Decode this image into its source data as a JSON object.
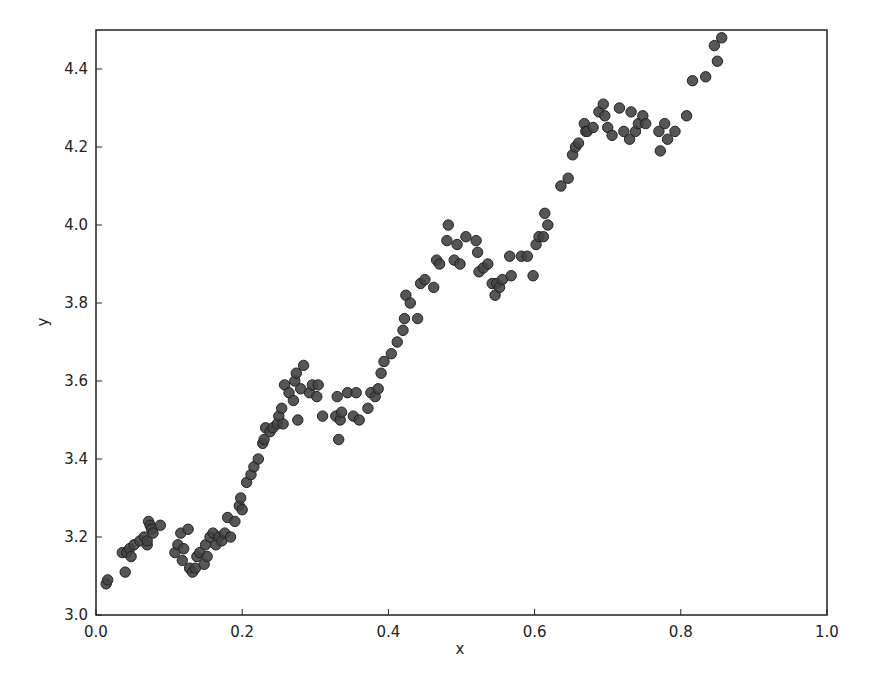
{
  "chart_data": {
    "type": "scatter",
    "title": "",
    "xlabel": "x",
    "ylabel": "y",
    "xlim": [
      0.0,
      1.0
    ],
    "ylim": [
      3.0,
      4.5
    ],
    "grid": false,
    "legend": null,
    "xticks": [
      "0.0",
      "0.2",
      "0.4",
      "0.6",
      "0.8",
      "1.0"
    ],
    "yticks": [
      "3.0",
      "3.2",
      "3.4",
      "3.6",
      "3.8",
      "4.0",
      "4.2",
      "4.4"
    ],
    "marker_color": "#444444",
    "marker_edge_color": "#222222",
    "series": [
      {
        "name": "data",
        "points": [
          [
            0.014,
            3.08
          ],
          [
            0.016,
            3.09
          ],
          [
            0.036,
            3.16
          ],
          [
            0.04,
            3.11
          ],
          [
            0.042,
            3.16
          ],
          [
            0.046,
            3.17
          ],
          [
            0.048,
            3.15
          ],
          [
            0.052,
            3.18
          ],
          [
            0.06,
            3.19
          ],
          [
            0.066,
            3.2
          ],
          [
            0.07,
            3.18
          ],
          [
            0.07,
            3.19
          ],
          [
            0.072,
            3.24
          ],
          [
            0.074,
            3.23
          ],
          [
            0.076,
            3.22
          ],
          [
            0.078,
            3.21
          ],
          [
            0.088,
            3.23
          ],
          [
            0.108,
            3.16
          ],
          [
            0.112,
            3.18
          ],
          [
            0.116,
            3.21
          ],
          [
            0.118,
            3.14
          ],
          [
            0.12,
            3.17
          ],
          [
            0.126,
            3.22
          ],
          [
            0.128,
            3.12
          ],
          [
            0.132,
            3.11
          ],
          [
            0.136,
            3.12
          ],
          [
            0.138,
            3.15
          ],
          [
            0.142,
            3.16
          ],
          [
            0.148,
            3.13
          ],
          [
            0.15,
            3.18
          ],
          [
            0.152,
            3.15
          ],
          [
            0.156,
            3.2
          ],
          [
            0.16,
            3.21
          ],
          [
            0.164,
            3.18
          ],
          [
            0.168,
            3.2
          ],
          [
            0.172,
            3.19
          ],
          [
            0.176,
            3.21
          ],
          [
            0.18,
            3.25
          ],
          [
            0.184,
            3.2
          ],
          [
            0.19,
            3.24
          ],
          [
            0.196,
            3.28
          ],
          [
            0.198,
            3.3
          ],
          [
            0.2,
            3.27
          ],
          [
            0.206,
            3.34
          ],
          [
            0.212,
            3.36
          ],
          [
            0.216,
            3.38
          ],
          [
            0.222,
            3.4
          ],
          [
            0.228,
            3.44
          ],
          [
            0.23,
            3.45
          ],
          [
            0.232,
            3.48
          ],
          [
            0.238,
            3.47
          ],
          [
            0.242,
            3.48
          ],
          [
            0.248,
            3.49
          ],
          [
            0.25,
            3.51
          ],
          [
            0.254,
            3.53
          ],
          [
            0.256,
            3.49
          ],
          [
            0.258,
            3.59
          ],
          [
            0.264,
            3.57
          ],
          [
            0.27,
            3.55
          ],
          [
            0.272,
            3.6
          ],
          [
            0.274,
            3.62
          ],
          [
            0.276,
            3.5
          ],
          [
            0.28,
            3.58
          ],
          [
            0.284,
            3.64
          ],
          [
            0.292,
            3.57
          ],
          [
            0.296,
            3.59
          ],
          [
            0.302,
            3.56
          ],
          [
            0.304,
            3.59
          ],
          [
            0.31,
            3.51
          ],
          [
            0.328,
            3.51
          ],
          [
            0.33,
            3.56
          ],
          [
            0.332,
            3.45
          ],
          [
            0.334,
            3.5
          ],
          [
            0.336,
            3.52
          ],
          [
            0.344,
            3.57
          ],
          [
            0.352,
            3.51
          ],
          [
            0.356,
            3.57
          ],
          [
            0.36,
            3.5
          ],
          [
            0.372,
            3.53
          ],
          [
            0.376,
            3.57
          ],
          [
            0.382,
            3.56
          ],
          [
            0.386,
            3.58
          ],
          [
            0.39,
            3.62
          ],
          [
            0.394,
            3.65
          ],
          [
            0.404,
            3.67
          ],
          [
            0.412,
            3.7
          ],
          [
            0.42,
            3.73
          ],
          [
            0.422,
            3.76
          ],
          [
            0.424,
            3.82
          ],
          [
            0.43,
            3.8
          ],
          [
            0.44,
            3.76
          ],
          [
            0.444,
            3.85
          ],
          [
            0.45,
            3.86
          ],
          [
            0.462,
            3.84
          ],
          [
            0.466,
            3.91
          ],
          [
            0.47,
            3.9
          ],
          [
            0.48,
            3.96
          ],
          [
            0.482,
            4.0
          ],
          [
            0.49,
            3.91
          ],
          [
            0.494,
            3.95
          ],
          [
            0.498,
            3.9
          ],
          [
            0.506,
            3.97
          ],
          [
            0.52,
            3.96
          ],
          [
            0.522,
            3.93
          ],
          [
            0.524,
            3.88
          ],
          [
            0.53,
            3.89
          ],
          [
            0.536,
            3.9
          ],
          [
            0.542,
            3.85
          ],
          [
            0.546,
            3.82
          ],
          [
            0.548,
            3.85
          ],
          [
            0.552,
            3.84
          ],
          [
            0.556,
            3.86
          ],
          [
            0.566,
            3.92
          ],
          [
            0.568,
            3.87
          ],
          [
            0.582,
            3.92
          ],
          [
            0.59,
            3.92
          ],
          [
            0.598,
            3.87
          ],
          [
            0.602,
            3.95
          ],
          [
            0.606,
            3.97
          ],
          [
            0.612,
            3.97
          ],
          [
            0.614,
            4.03
          ],
          [
            0.618,
            4.0
          ],
          [
            0.636,
            4.1
          ],
          [
            0.646,
            4.12
          ],
          [
            0.652,
            4.18
          ],
          [
            0.656,
            4.2
          ],
          [
            0.66,
            4.21
          ],
          [
            0.668,
            4.26
          ],
          [
            0.67,
            4.24
          ],
          [
            0.672,
            4.24
          ],
          [
            0.68,
            4.25
          ],
          [
            0.688,
            4.29
          ],
          [
            0.694,
            4.31
          ],
          [
            0.696,
            4.28
          ],
          [
            0.7,
            4.25
          ],
          [
            0.706,
            4.23
          ],
          [
            0.716,
            4.3
          ],
          [
            0.722,
            4.24
          ],
          [
            0.73,
            4.22
          ],
          [
            0.732,
            4.29
          ],
          [
            0.738,
            4.24
          ],
          [
            0.742,
            4.26
          ],
          [
            0.748,
            4.28
          ],
          [
            0.752,
            4.26
          ],
          [
            0.77,
            4.24
          ],
          [
            0.772,
            4.19
          ],
          [
            0.778,
            4.26
          ],
          [
            0.782,
            4.22
          ],
          [
            0.792,
            4.24
          ],
          [
            0.808,
            4.28
          ],
          [
            0.816,
            4.37
          ],
          [
            0.834,
            4.38
          ],
          [
            0.846,
            4.46
          ],
          [
            0.85,
            4.42
          ],
          [
            0.856,
            4.48
          ]
        ]
      }
    ]
  }
}
